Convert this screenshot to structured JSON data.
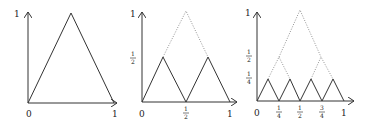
{
  "diagram": {
    "colors": {
      "line": "#333333",
      "dotted": "#777777",
      "background": "#ffffff"
    },
    "panels": [
      {
        "id": "panel-1",
        "y_labels": [
          "1"
        ],
        "x_labels": [
          "0",
          "1"
        ],
        "solid_peaks": 1,
        "peak_height": "1"
      },
      {
        "id": "panel-2",
        "y_labels": [
          "1",
          "1/2"
        ],
        "x_labels": [
          "0",
          "1/2",
          "1"
        ],
        "solid_peaks": 2,
        "peak_height": "1/2",
        "dotted_envelope": true
      },
      {
        "id": "panel-3",
        "y_labels": [
          "1",
          "1/2",
          "1/4"
        ],
        "x_labels": [
          "0",
          "1/4",
          "1/2",
          "3/4",
          "1"
        ],
        "solid_peaks": 4,
        "peak_height": "1/4",
        "dotted_envelope": true
      }
    ],
    "labels": {
      "one": "1",
      "zero": "0",
      "half_num": "1",
      "half_den": "2",
      "quarter_num": "1",
      "quarter_den": "4",
      "threeq_num": "3",
      "threeq_den": "4"
    }
  }
}
